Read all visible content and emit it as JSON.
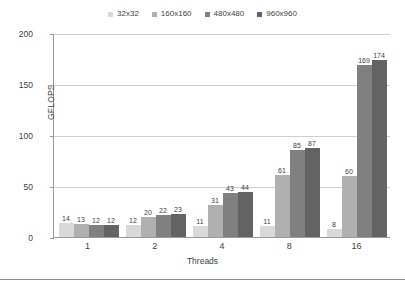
{
  "chart_data": {
    "type": "bar",
    "title": "",
    "xlabel": "Threads",
    "ylabel": "GFLOPS",
    "categories": [
      "1",
      "2",
      "4",
      "8",
      "16"
    ],
    "ylim": [
      0,
      200
    ],
    "yticks": [
      "0",
      "50",
      "100",
      "150",
      "200"
    ],
    "grid": true,
    "legend_position": "top-center",
    "series": [
      {
        "name": "32x32",
        "color": "#d9d9d9",
        "values": [
          14,
          12,
          11,
          11,
          8
        ]
      },
      {
        "name": "160x160",
        "color": "#b0b0b0",
        "values": [
          13,
          20,
          31,
          61,
          60
        ]
      },
      {
        "name": "480x480",
        "color": "#808080",
        "values": [
          12,
          22,
          43,
          85,
          169
        ]
      },
      {
        "name": "960x960",
        "color": "#636363",
        "values": [
          12,
          23,
          44,
          87,
          174
        ]
      }
    ]
  }
}
